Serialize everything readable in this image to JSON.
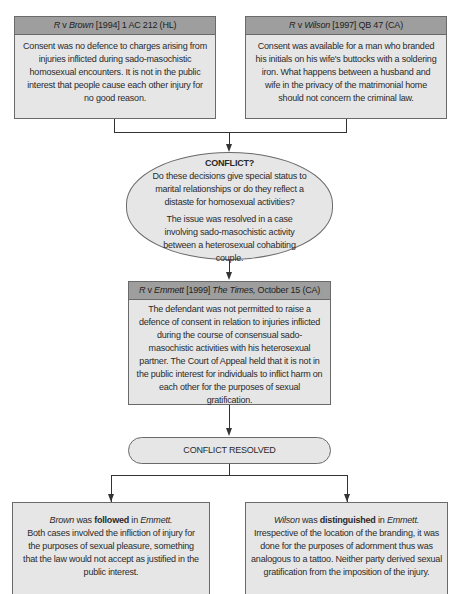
{
  "boxes": {
    "brown": {
      "header_case": "R",
      "header_v": " v ",
      "header_name": "Brown",
      "header_cite": " [1994] 1 AC 212 (HL)",
      "body": "Consent was no defence to charges arising from injuries inflicted during sado-masochistic homosexual encounters. It is not in the public interest that people cause each other injury for no good reason."
    },
    "wilson": {
      "header_case": "R",
      "header_v": " v ",
      "header_name": "Wilson",
      "header_cite": " [1997] QB 47 (CA)",
      "body": "Consent was available for a man who branded his initials on his wife's buttocks with a soldering iron. What happens between a husband and wife in the privacy of the matrimonial home should not concern the criminal law."
    },
    "conflict": {
      "title": "CONFLICT?",
      "question": "Do these decisions give special status to marital relationships or do they reflect a distaste for homosexual activities?",
      "resolution": "The issue was resolved in a case involving sado-masochistic activity between a heterosexual cohabiting couple."
    },
    "emmett": {
      "header_case": "R",
      "header_v": " v ",
      "header_name": "Emmett",
      "header_cite": " [1999] ",
      "header_report": "The Times,",
      "header_rest": " October 15 (CA)",
      "body": "The defendant was not permitted to raise a defence of consent in relation to injuries inflicted during the course of consensual sado-masochistic activities with his heterosexual partner. The Court of Appeal held that it is not in the public interest for individuals to inflict harm on each other for the purposes of sexual gratification."
    },
    "resolved": {
      "label": "CONFLICT RESOLVED"
    },
    "followed": {
      "case1": "Brown",
      "mid1": " was ",
      "verb": "followed",
      "mid2": " in ",
      "case2": "Emmett.",
      "body": "Both cases involved the infliction of injury for the purposes of sexual pleasure, something that the law would not accept as justified in the public interest."
    },
    "distinguished": {
      "case1": "Wilson",
      "mid1": " was ",
      "verb": "distinguished",
      "mid2": " in ",
      "case2": "Emmett.",
      "body": "Irrespective of the location of the branding, it was done for the purposes of adornment thus was analogous to a tattoo. Neither party derived sexual gratification from the imposition of the injury."
    }
  }
}
